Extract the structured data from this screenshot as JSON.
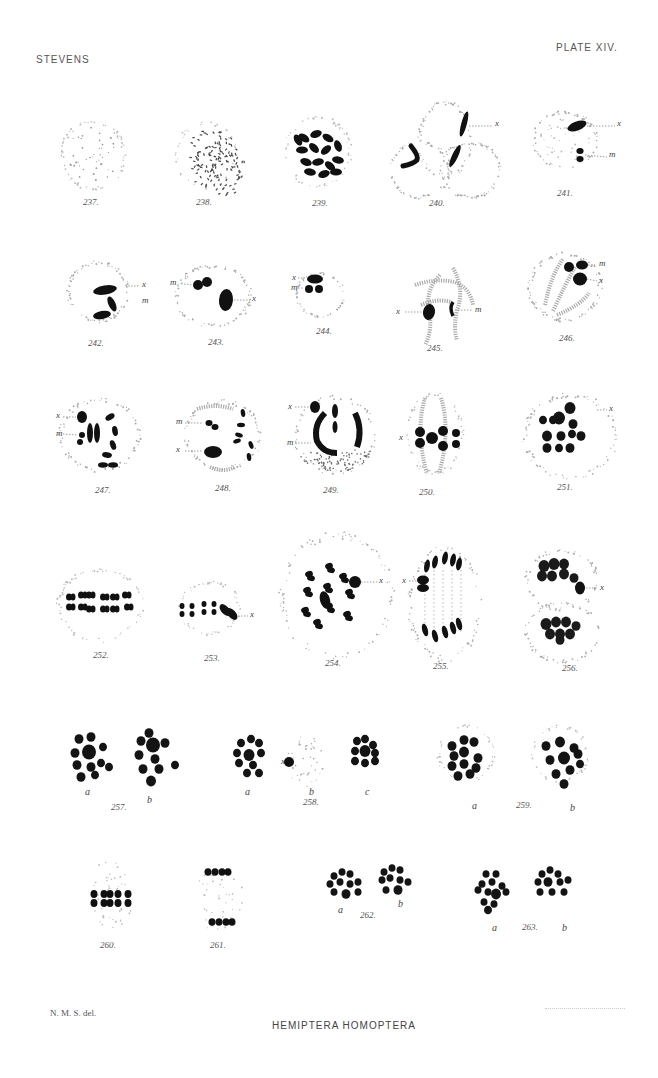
{
  "header": {
    "author": "STEVENS",
    "plate": "PLATE XIV."
  },
  "footer": {
    "artist_credit": "N. M. S. del.",
    "title": "HEMIPTERA HOMOPTERA"
  },
  "figures": [
    {
      "number": "237.",
      "labels": []
    },
    {
      "number": "238.",
      "labels": []
    },
    {
      "number": "239.",
      "labels": []
    },
    {
      "number": "240.",
      "labels": [
        "x"
      ]
    },
    {
      "number": "241.",
      "labels": [
        "x",
        "m"
      ]
    },
    {
      "number": "242.",
      "labels": [
        "x",
        "m"
      ]
    },
    {
      "number": "243.",
      "labels": [
        "m",
        "x"
      ]
    },
    {
      "number": "244.",
      "labels": [
        "x",
        "m"
      ]
    },
    {
      "number": "245.",
      "labels": [
        "x",
        "m"
      ]
    },
    {
      "number": "246.",
      "labels": [
        "m",
        "x"
      ]
    },
    {
      "number": "247.",
      "labels": [
        "x",
        "m"
      ]
    },
    {
      "number": "248.",
      "labels": [
        "m",
        "x"
      ]
    },
    {
      "number": "249.",
      "labels": [
        "x",
        "m"
      ]
    },
    {
      "number": "250.",
      "labels": [
        "x"
      ]
    },
    {
      "number": "251.",
      "labels": [
        "x"
      ]
    },
    {
      "number": "252.",
      "labels": []
    },
    {
      "number": "253.",
      "labels": [
        "x"
      ]
    },
    {
      "number": "254.",
      "labels": [
        "x"
      ]
    },
    {
      "number": "255.",
      "labels": [
        "x"
      ]
    },
    {
      "number": "256.",
      "labels": [
        "x"
      ]
    },
    {
      "number": "257.",
      "subfigures": [
        "a",
        "b"
      ]
    },
    {
      "number": "258.",
      "subfigures": [
        "a",
        "b",
        "c"
      ],
      "labels": [
        "x"
      ]
    },
    {
      "number": "259.",
      "subfigures": [
        "a",
        "b"
      ]
    },
    {
      "number": "260.",
      "labels": []
    },
    {
      "number": "261.",
      "labels": []
    },
    {
      "number": "262.",
      "subfigures": [
        "a",
        "b"
      ]
    },
    {
      "number": "263.",
      "subfigures": [
        "a",
        "b"
      ]
    }
  ]
}
